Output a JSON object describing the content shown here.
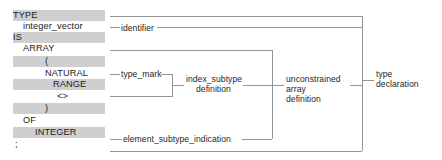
{
  "figure": {
    "kind": "syntax-annotation-diagram",
    "language_construct": "Ada array type declaration",
    "colors": {
      "highlight_band": "#cfcfcf",
      "text": "#1b1b1b",
      "rule_line": "#808080"
    }
  },
  "code": {
    "lines": [
      {
        "indent": 0,
        "text": "TYPE",
        "highlighted": true
      },
      {
        "indent": 1,
        "text": "integer_vector",
        "highlighted": false
      },
      {
        "indent": 0,
        "text": "IS",
        "highlighted": true
      },
      {
        "indent": 1,
        "text": "ARRAY",
        "highlighted": false
      },
      {
        "indent": 2,
        "text": "(",
        "highlighted": true
      },
      {
        "indent": 3,
        "text": "NATURAL",
        "highlighted": false
      },
      {
        "indent": 3,
        "text": "RANGE",
        "highlighted": true
      },
      {
        "indent": 3,
        "text": "<>",
        "highlighted": false
      },
      {
        "indent": 2,
        "text": ")",
        "highlighted": true
      },
      {
        "indent": 1,
        "text": "OF",
        "highlighted": false
      },
      {
        "indent": 2,
        "text": "INTEGER",
        "highlighted": true
      },
      {
        "indent": 0,
        "text": ";",
        "highlighted": false
      }
    ]
  },
  "annotations": {
    "identifier": "identifier",
    "type_mark": "type_mark",
    "index_subtype_definition_line1": "index_subtype",
    "index_subtype_definition_line2": "definition",
    "element_subtype_indication": "element_subtype_indication",
    "unconstrained_line1": "unconstrained",
    "unconstrained_line2": "array",
    "unconstrained_line3": "definition",
    "type_declaration_line1": "type",
    "type_declaration_line2": "declaration"
  }
}
